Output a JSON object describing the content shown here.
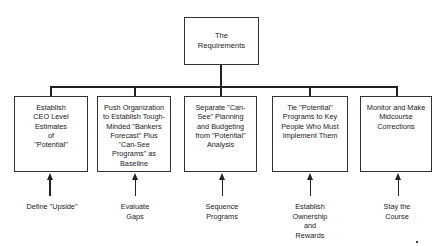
{
  "title": "The\nRequirements",
  "requirements": [
    {
      "box_text": "Establish\nCEO Level\nEstimates\nof\n\"Potential\"",
      "action": "Define \"Upside\""
    },
    {
      "box_text": "Push Organization\nto Establish Tough-\nMinded \"Bankers\nForecast\" Plus\n\"Can-See\nPrograms\" as\nBaseline",
      "action": "Evaluate\nGaps"
    },
    {
      "box_text": "Separate \"Can-\nSee\" Planning\nand Budgeting\nfrom \"Potential\"\nAnalysis",
      "action": "Sequence\nPrograms"
    },
    {
      "box_text": "Tie \"Potential\"\nPrograms to Key\nPeople Who Must\nImplement Them",
      "action": "Establish\nOwnership\nand\nRewards"
    },
    {
      "box_text": "Monitor and Make\nMidcourse\nCorrections",
      "action": "Stay the\nCourse"
    }
  ],
  "colors": {
    "line": "#222222",
    "background": "#ffffff"
  }
}
